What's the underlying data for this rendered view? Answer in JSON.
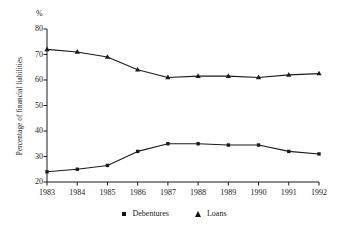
{
  "chart_data": {
    "type": "line",
    "title": "",
    "subtitle": "",
    "unit_label": "%",
    "xlabel": "",
    "ylabel": "Percentage of financial liabilities",
    "categories": [
      "1983",
      "1984",
      "1985",
      "1986",
      "1987",
      "1988",
      "1989",
      "1990",
      "1991",
      "1992"
    ],
    "x": [
      1983,
      1984,
      1985,
      1986,
      1987,
      1988,
      1989,
      1990,
      1991,
      1992
    ],
    "series": [
      {
        "name": "Debentures",
        "marker": "square",
        "color": "#1a1a1a",
        "values": [
          24,
          25,
          26.5,
          32,
          35,
          35,
          34.5,
          34.5,
          32,
          31
        ]
      },
      {
        "name": "Loans",
        "marker": "triangle",
        "color": "#1a1a1a",
        "values": [
          72,
          71,
          69,
          64,
          61,
          61.5,
          61.5,
          61,
          62,
          62.5
        ]
      }
    ],
    "ylim": [
      20,
      80
    ],
    "yticks": [
      20,
      30,
      40,
      50,
      60,
      70,
      80
    ],
    "ytick_labels": [
      "20",
      "30",
      "40",
      "50",
      "60",
      "70",
      "80"
    ],
    "xlim": [
      1983,
      1992
    ],
    "grid": false,
    "legend_position": "bottom-center",
    "legend_entries": [
      "Debentures",
      "Loans"
    ]
  },
  "axes": {
    "y_axis_name": "y-axis",
    "x_axis_name": "x-axis"
  }
}
